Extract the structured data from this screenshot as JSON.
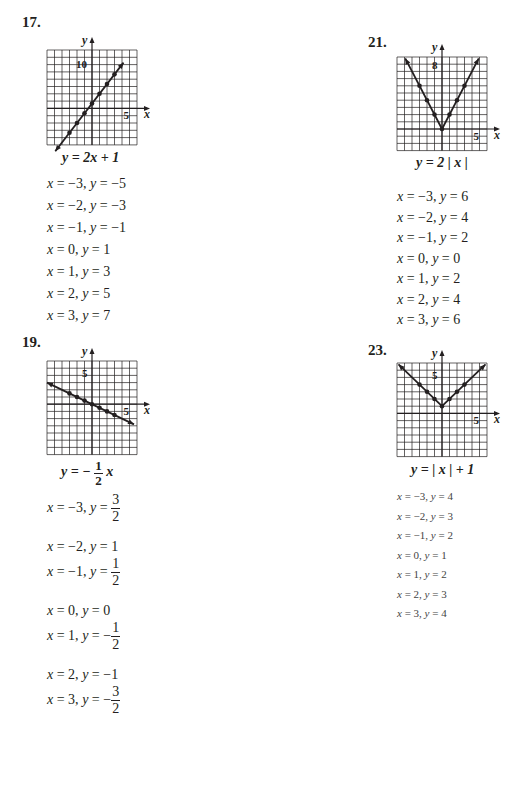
{
  "problems": [
    {
      "number": "17.",
      "equation": "y = 2x + 1",
      "x_tick_label": "5",
      "y_tick_label": "10",
      "axis_x": "x",
      "axis_y": "y",
      "table": [
        {
          "x": "−3",
          "y": "−5"
        },
        {
          "x": "−2",
          "y": "−3"
        },
        {
          "x": "−1",
          "y": "−1"
        },
        {
          "x": "0",
          "y": "1"
        },
        {
          "x": "1",
          "y": "3"
        },
        {
          "x": "2",
          "y": "5"
        },
        {
          "x": "3",
          "y": "7"
        }
      ]
    },
    {
      "number": "19.",
      "equation_prefix": "y = −",
      "equation_frac_num": "1",
      "equation_frac_den": "2",
      "equation_suffix": "x",
      "x_tick_label": "5",
      "y_tick_label": "5",
      "axis_x": "x",
      "axis_y": "y",
      "table": [
        {
          "x": "−3",
          "y_prefix": "",
          "num": "3",
          "den": "2"
        },
        {
          "x": "−2",
          "y": "1"
        },
        {
          "x": "−1",
          "y_prefix": "",
          "num": "1",
          "den": "2"
        },
        {
          "x": "0",
          "y": "0"
        },
        {
          "x": "1",
          "y_prefix": "−",
          "num": "1",
          "den": "2"
        },
        {
          "x": "2",
          "y": "−1"
        },
        {
          "x": "3",
          "y_prefix": "−",
          "num": "3",
          "den": "2"
        }
      ]
    },
    {
      "number": "21.",
      "equation": "y = 2 | x |",
      "x_tick_label": "5",
      "y_tick_label": "8",
      "axis_x": "x",
      "axis_y": "y",
      "table": [
        {
          "x": "−3",
          "y": "6"
        },
        {
          "x": "−2",
          "y": "4"
        },
        {
          "x": "−1",
          "y": "2"
        },
        {
          "x": "0",
          "y": "0"
        },
        {
          "x": "1",
          "y": "2"
        },
        {
          "x": "2",
          "y": "4"
        },
        {
          "x": "3",
          "y": "6"
        }
      ]
    },
    {
      "number": "23.",
      "equation": "y = | x | + 1",
      "x_tick_label": "5",
      "y_tick_label": "5",
      "axis_x": "x",
      "axis_y": "y",
      "table": [
        {
          "x": "−3",
          "y": "4"
        },
        {
          "x": "−2",
          "y": "3"
        },
        {
          "x": "−1",
          "y": "2"
        },
        {
          "x": "0",
          "y": "1"
        },
        {
          "x": "1",
          "y": "2"
        },
        {
          "x": "2",
          "y": "3"
        },
        {
          "x": "3",
          "y": "4"
        }
      ]
    }
  ],
  "labels": {
    "x_eq": "x = ",
    "y_eq": ", y = "
  },
  "colors": {
    "ink": "#231f20",
    "grid": "#231f20",
    "paper": "#ffffff"
  }
}
